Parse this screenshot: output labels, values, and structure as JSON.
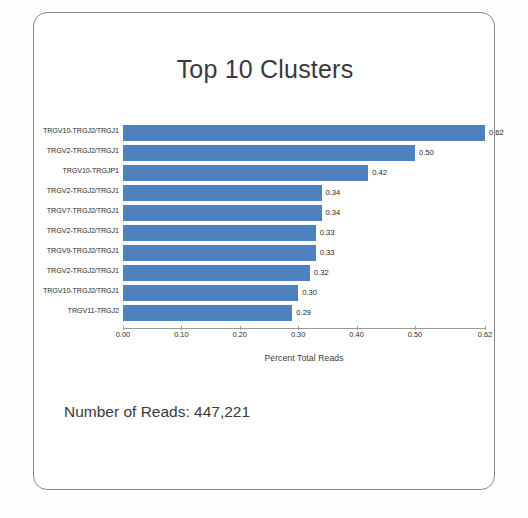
{
  "slide": {
    "title": "Top 10 Clusters",
    "reads_note": "Number of Reads: 447,221"
  },
  "chart_data": {
    "type": "bar",
    "orientation": "horizontal",
    "title": "Top 10 Clusters",
    "xlabel": "Percent Total Reads",
    "ylabel": "",
    "grid": false,
    "legend": "none",
    "xlim": [
      0.0,
      0.62
    ],
    "xticks": [
      "0.00",
      "0.10",
      "0.20",
      "0.30",
      "0.40",
      "0.50",
      "0.62"
    ],
    "xtick_values": [
      0.0,
      0.1,
      0.2,
      0.3,
      0.4,
      0.5,
      0.62
    ],
    "bar_color": "#4E81BD",
    "categories": [
      "TRGV10-TRGJ2/TRGJ1",
      "TRGV2-TRGJ2/TRGJ1",
      "TRGV10-TRGJP1",
      "TRGV2-TRGJ2/TRGJ1",
      "TRGV7-TRGJ2/TRGJ1",
      "TRGV2-TRGJ2/TRGJ1",
      "TRGV9-TRGJ2/TRGJ1",
      "TRGV2-TRGJ2/TRGJ1",
      "TRGV10-TRGJ2/TRGJ1",
      "TRGV11-TRGJ2"
    ],
    "values": [
      0.62,
      0.5,
      0.42,
      0.34,
      0.34,
      0.33,
      0.33,
      0.32,
      0.3,
      0.29
    ],
    "value_labels": [
      "0.62",
      "0.50",
      "0.42",
      "0.34",
      "0.34",
      "0.33",
      "0.33",
      "0.32",
      "0.30",
      "0.29"
    ]
  }
}
